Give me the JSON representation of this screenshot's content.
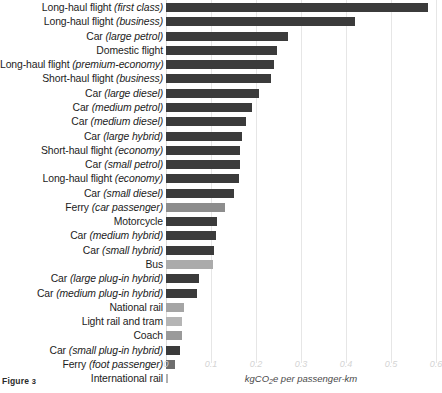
{
  "figure": {
    "caption_prefix": "Figure",
    "caption_number": "3"
  },
  "chart_data": {
    "type": "bar",
    "orientation": "horizontal",
    "title": "",
    "xlabel": "kgCO2e per passenger-km",
    "xlabel_display": "kgCO₂e per passenger-km",
    "ylabel": "",
    "xlim": [
      0,
      0.6
    ],
    "xticks": [
      0,
      0.1,
      0.2,
      0.3,
      0.4,
      0.5,
      0.6
    ],
    "xtick_labels": [
      "0",
      "0.1",
      "0.2",
      "0.3",
      "0.4",
      "0.5",
      "0.6"
    ],
    "grid": true,
    "grid_axis": "x",
    "legend": null,
    "units": "kgCO2e per passenger-km",
    "categories": [
      "Long-haul flight (first class)",
      "Long-haul flight (business)",
      "Car (large petrol)",
      "Domestic flight",
      "Long-haul flight (premium-economy)",
      "Short-haul flight (business)",
      "Car (large diesel)",
      "Car (medium petrol)",
      "Car (medium diesel)",
      "Car (large hybrid)",
      "Short-haul flight (economy)",
      "Car (small petrol)",
      "Long-haul flight (economy)",
      "Car (small diesel)",
      "Ferry (car passenger)",
      "Motorcycle",
      "Car (medium hybrid)",
      "Car (small hybrid)",
      "Bus",
      "Car (large plug-in hybrid)",
      "Car (medium plug-in hybrid)",
      "National rail",
      "Light rail and tram",
      "Coach",
      "Car (small plug-in hybrid)",
      "Ferry (foot passenger)",
      "International rail"
    ],
    "values": [
      0.583,
      0.421,
      0.271,
      0.246,
      0.24,
      0.234,
      0.207,
      0.192,
      0.177,
      0.168,
      0.165,
      0.164,
      0.163,
      0.15,
      0.13,
      0.114,
      0.11,
      0.106,
      0.104,
      0.073,
      0.068,
      0.04,
      0.035,
      0.035,
      0.031,
      0.019,
      0.005
    ]
  },
  "rows": [
    {
      "plain": "Long-haul flight ",
      "italic": "(first class)",
      "value": 0.583,
      "color": "#3b3b3b"
    },
    {
      "plain": "Long-haul flight ",
      "italic": "(business)",
      "value": 0.421,
      "color": "#3b3b3b"
    },
    {
      "plain": "Car ",
      "italic": "(large petrol)",
      "value": 0.271,
      "color": "#3b3b3b"
    },
    {
      "plain": "Domestic flight",
      "italic": "",
      "value": 0.246,
      "color": "#3b3b3b"
    },
    {
      "plain": "Long-haul flight ",
      "italic": "(premium-economy)",
      "value": 0.24,
      "color": "#3b3b3b"
    },
    {
      "plain": "Short-haul flight ",
      "italic": "(business)",
      "value": 0.234,
      "color": "#3b3b3b"
    },
    {
      "plain": "Car ",
      "italic": "(large diesel)",
      "value": 0.207,
      "color": "#3b3b3b"
    },
    {
      "plain": "Car ",
      "italic": "(medium petrol)",
      "value": 0.192,
      "color": "#3b3b3b"
    },
    {
      "plain": "Car ",
      "italic": "(medium diesel)",
      "value": 0.177,
      "color": "#3b3b3b"
    },
    {
      "plain": "Car ",
      "italic": "(large hybrid)",
      "value": 0.168,
      "color": "#3b3b3b"
    },
    {
      "plain": "Short-haul flight ",
      "italic": "(economy)",
      "value": 0.165,
      "color": "#3b3b3b"
    },
    {
      "plain": "Car ",
      "italic": "(small petrol)",
      "value": 0.164,
      "color": "#3b3b3b"
    },
    {
      "plain": "Long-haul flight ",
      "italic": "(economy)",
      "value": 0.163,
      "color": "#3b3b3b"
    },
    {
      "plain": "Car ",
      "italic": "(small diesel)",
      "value": 0.15,
      "color": "#3b3b3b"
    },
    {
      "plain": "Ferry ",
      "italic": "(car passenger)",
      "value": 0.13,
      "color": "#8d8d8d"
    },
    {
      "plain": "Motorcycle",
      "italic": "",
      "value": 0.114,
      "color": "#3b3b3b"
    },
    {
      "plain": "Car ",
      "italic": "(medium hybrid)",
      "value": 0.11,
      "color": "#3b3b3b"
    },
    {
      "plain": "Car ",
      "italic": "(small hybrid)",
      "value": 0.106,
      "color": "#3b3b3b"
    },
    {
      "plain": "Bus",
      "italic": "",
      "value": 0.104,
      "color": "#ababab"
    },
    {
      "plain": "Car ",
      "italic": "(large plug-in hybrid)",
      "value": 0.073,
      "color": "#3b3b3b"
    },
    {
      "plain": "Car ",
      "italic": "(medium plug-in hybrid)",
      "value": 0.068,
      "color": "#3b3b3b"
    },
    {
      "plain": "National rail",
      "italic": "",
      "value": 0.04,
      "color": "#a5a5a5"
    },
    {
      "plain": "Light rail and tram",
      "italic": "",
      "value": 0.035,
      "color": "#b5b5b5"
    },
    {
      "plain": "Coach",
      "italic": "",
      "value": 0.035,
      "color": "#9a9a9a"
    },
    {
      "plain": "Car ",
      "italic": "(small plug-in hybrid)",
      "value": 0.031,
      "color": "#3b3b3b"
    },
    {
      "plain": "Ferry ",
      "italic": "(foot passenger)",
      "value": 0.019,
      "color": "#6e6e6e"
    },
    {
      "plain": "International rail",
      "italic": "",
      "value": 0.005,
      "color": "#b0b0b0"
    }
  ]
}
